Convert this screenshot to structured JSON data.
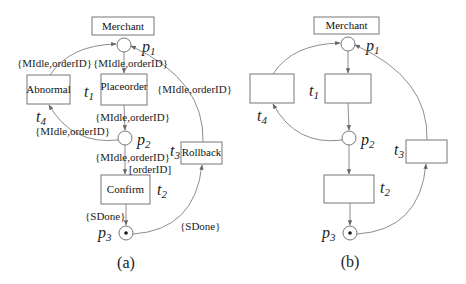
{
  "figure_a": {
    "caption": "(a)",
    "title_box": "Merchant",
    "places": {
      "p1": {
        "letter": "p",
        "sub": "1"
      },
      "p2": {
        "letter": "p",
        "sub": "2"
      },
      "p3": {
        "letter": "p",
        "sub": "3",
        "token": true
      }
    },
    "transitions": {
      "t1": {
        "letter": "t",
        "sub": "1",
        "label": "Placeorder"
      },
      "t2": {
        "letter": "t",
        "sub": "2",
        "label": "Confirm"
      },
      "t3": {
        "letter": "t",
        "sub": "3",
        "label": "Rollback"
      },
      "t4": {
        "letter": "t",
        "sub": "4",
        "label": "Abnormal"
      }
    },
    "arc_labels": {
      "t4_p1": "{MIdle,orderID}",
      "p1_t1": "{MIdle,orderID}",
      "t3_p1": "{MIdle,orderID}",
      "t1_p2": "{MIdle,orderID}",
      "p2_t4": "{MIdle,orderID}",
      "p2_t2": "{MIdle,orderID}",
      "p2_t2_guard": "[orderID]",
      "t2_p3": "{SDone}",
      "p3_t3": "{SDone}"
    }
  },
  "figure_b": {
    "caption": "(b)",
    "title_box": "Merchant",
    "places": {
      "p1": {
        "letter": "p",
        "sub": "1"
      },
      "p2": {
        "letter": "p",
        "sub": "2"
      },
      "p3": {
        "letter": "p",
        "sub": "3",
        "token": true
      }
    },
    "transitions": {
      "t1": {
        "letter": "t",
        "sub": "1"
      },
      "t2": {
        "letter": "t",
        "sub": "2"
      },
      "t3": {
        "letter": "t",
        "sub": "3"
      },
      "t4": {
        "letter": "t",
        "sub": "4"
      }
    }
  },
  "colors": {
    "stroke": "#777777",
    "text": "#222222",
    "background": "#ffffff"
  }
}
